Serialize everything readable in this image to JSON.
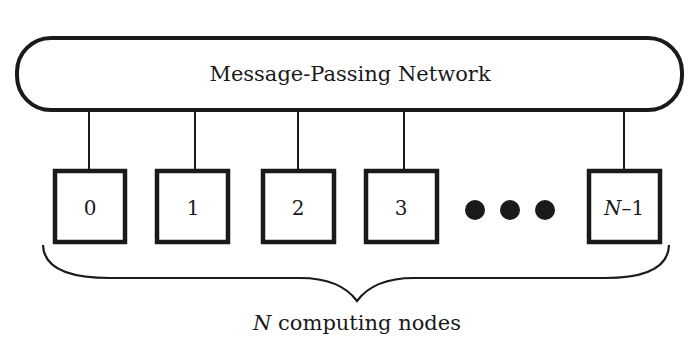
{
  "network": {
    "label": "Message-Passing Network"
  },
  "nodes": [
    {
      "label": "0",
      "italic_prefix": ""
    },
    {
      "label": "1",
      "italic_prefix": ""
    },
    {
      "label": "2",
      "italic_prefix": ""
    },
    {
      "label": "3",
      "italic_prefix": ""
    },
    {
      "label": "–1",
      "italic_prefix": "N"
    }
  ],
  "ellipsis": {
    "icon": "three-dots-ellipsis"
  },
  "brace": {
    "label_var": "N",
    "label_text": " computing nodes"
  },
  "colors": {
    "stroke": "#1a1a1a",
    "background": "#ffffff"
  }
}
